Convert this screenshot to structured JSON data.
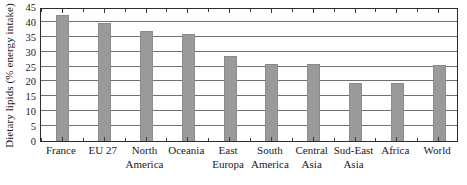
{
  "chart_data": {
    "type": "bar",
    "title": "",
    "xlabel": "",
    "ylabel": "Dietary lipids (% energy intake)",
    "ylim": [
      0,
      45
    ],
    "ytick_step": 5,
    "yticks": [
      0,
      5,
      10,
      15,
      20,
      25,
      30,
      35,
      40,
      45
    ],
    "grid": true,
    "legend": "none",
    "bar_color": "#9a9a9a",
    "axis_color": "#2b2b2b",
    "gridline_color": "#6f6f6f",
    "categories": [
      "France",
      "EU 27",
      "North America",
      "Oceania",
      "East Europa",
      "South America",
      "Central Asia",
      "Sud-East Asia",
      "Africa",
      "World"
    ],
    "category_lines": [
      [
        "France",
        ""
      ],
      [
        "EU 27",
        ""
      ],
      [
        "North",
        "America"
      ],
      [
        "Oceania",
        ""
      ],
      [
        "East",
        "Europa"
      ],
      [
        "South",
        "America"
      ],
      [
        "Central",
        "Asia"
      ],
      [
        "Sud-East",
        "Asia"
      ],
      [
        "Africa",
        ""
      ],
      [
        "World",
        ""
      ]
    ],
    "values": [
      42.0,
      39.4,
      36.6,
      35.6,
      28.2,
      25.6,
      25.5,
      19.0,
      19.3,
      25.3
    ]
  }
}
